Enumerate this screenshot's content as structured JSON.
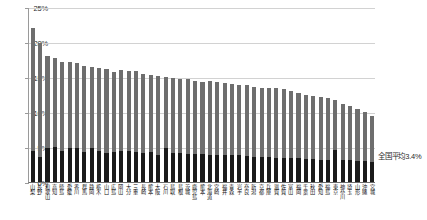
{
  "chart_data": {
    "type": "bar",
    "title": "",
    "subtitle": "",
    "xlabel": "",
    "ylabel": "",
    "ylim": [
      0,
      25
    ],
    "ytick_labels": [
      "0%",
      "5%",
      "10%",
      "15%",
      "20%",
      "25%"
    ],
    "ytick_values": [
      0,
      5,
      10,
      15,
      20,
      25
    ],
    "grid": true,
    "legend_position": "none",
    "stacked": true,
    "value_unit": "%",
    "annotations": [
      {
        "name": "national-average",
        "text": "全国平均3.4%",
        "value": 3.4
      }
    ],
    "colors": {
      "upper_series": "#6e6e6e",
      "lower_series": "#1a1a1a",
      "gridline": "#d2d2d2",
      "axis": "#6d6d6d"
    },
    "categories": [
      "山梨",
      "長野",
      "和歌山",
      "高知",
      "徳島",
      "愛媛",
      "香川",
      "群馬",
      "静岡",
      "栃木",
      "山口",
      "広島",
      "岡山",
      "大分",
      "三重",
      "長崎",
      "熊本",
      "大阪",
      "石川",
      "鳥取",
      "島根",
      "茨城",
      "鹿児島",
      "熊本",
      "北海道",
      "宮崎",
      "福井",
      "青森",
      "岩手",
      "奈良",
      "新潟",
      "京都",
      "兵庫",
      "滋賀",
      "佐賀",
      "富山",
      "福岡",
      "千葉",
      "秋田",
      "愛知",
      "福島",
      "東京",
      "神奈川",
      "埼玉",
      "山形",
      "沖縄",
      "宮城"
    ],
    "series": [
      {
        "name": "下段",
        "values": [
          4.4,
          3.6,
          4.9,
          5.0,
          4.5,
          4.8,
          4.9,
          4.3,
          4.8,
          4.4,
          4.2,
          4.3,
          4.4,
          4.4,
          4.3,
          4.2,
          4.3,
          3.9,
          4.9,
          4.2,
          4.1,
          4.0,
          4.0,
          4.0,
          3.8,
          3.9,
          3.9,
          3.8,
          3.8,
          3.7,
          3.6,
          3.6,
          3.6,
          3.5,
          3.5,
          3.4,
          3.4,
          3.3,
          3.3,
          3.2,
          3.2,
          4.6,
          3.1,
          3.1,
          3.0,
          3.0,
          2.9
        ]
      },
      {
        "name": "上段",
        "values": [
          17.6,
          16.2,
          13.1,
          12.7,
          12.7,
          12.3,
          12.1,
          12.3,
          11.7,
          11.9,
          11.9,
          11.4,
          11.6,
          11.5,
          11.5,
          11.2,
          11.0,
          11.3,
          10.1,
          10.6,
          10.6,
          10.7,
          10.5,
          10.3,
          10.6,
          10.4,
          10.3,
          10.2,
          10.1,
          10.1,
          10.0,
          9.9,
          9.9,
          9.9,
          9.8,
          9.6,
          9.3,
          9.2,
          9.0,
          8.9,
          8.8,
          7.1,
          8.1,
          7.8,
          7.4,
          7.0,
          6.6
        ]
      }
    ],
    "totals": [
      22.0,
      19.8,
      18.0,
      17.7,
      17.2,
      17.1,
      17.0,
      16.6,
      16.5,
      16.3,
      16.1,
      15.7,
      16.0,
      15.9,
      15.8,
      15.4,
      15.3,
      15.2,
      15.0,
      14.8,
      14.7,
      14.7,
      14.5,
      14.3,
      14.4,
      14.3,
      14.2,
      14.0,
      13.9,
      13.8,
      13.6,
      13.5,
      13.5,
      13.4,
      13.3,
      13.0,
      12.7,
      12.5,
      12.3,
      12.1,
      12.0,
      11.7,
      11.2,
      10.9,
      10.4,
      10.0,
      9.5
    ]
  }
}
